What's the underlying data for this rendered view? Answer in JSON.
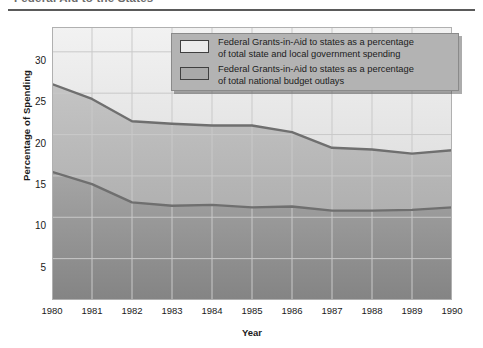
{
  "caption": "Federal Aid to the States",
  "chart_data": {
    "type": "area",
    "title": "Federal Aid to the States",
    "xlabel": "Year",
    "ylabel": "Percentage of Spending",
    "x": [
      1980,
      1981,
      1982,
      1983,
      1984,
      1985,
      1986,
      1987,
      1988,
      1989,
      1990
    ],
    "xticklabels": [
      "1980",
      "1981",
      "1982",
      "1983",
      "1984",
      "1985",
      "1986",
      "1987",
      "1988",
      "1989",
      "1990"
    ],
    "yticklabels": [
      "5",
      "10",
      "15",
      "20",
      "25",
      "30"
    ],
    "yticks": [
      5,
      10,
      15,
      20,
      25,
      30
    ],
    "ylim": [
      0,
      33
    ],
    "xlim": [
      1980,
      1990
    ],
    "grid": true,
    "legend_position": "upper-right-inside",
    "series": [
      {
        "name": "Federal Grants-in-Aid to states as a percentage of total state and local government spending",
        "swatch": "light",
        "color": "#ececec",
        "line_color": "#6f6f6f",
        "values": [
          26.1,
          24.3,
          21.6,
          21.3,
          21.1,
          21.1,
          20.3,
          18.4,
          18.2,
          17.7,
          18.1
        ]
      },
      {
        "name": "Federal Grants-in-Aid to states as a percentage of total national budget outlays",
        "swatch": "dark",
        "color": "#b0b0b0",
        "line_color": "#6f6f6f",
        "values": [
          15.5,
          14.0,
          11.8,
          11.4,
          11.5,
          11.2,
          11.3,
          10.8,
          10.8,
          10.9,
          11.2
        ]
      }
    ]
  },
  "legend": {
    "items": [
      {
        "line1": "Federal Grants-in-Aid to states as a percentage",
        "line2": "of total state and local government spending"
      },
      {
        "line1": "Federal Grants-in-Aid to states as a percentage",
        "line2": "of total national budget outlays"
      }
    ]
  },
  "colors": {
    "band_top": "#ededed",
    "band_middle": "#b8b8b8",
    "band_bottom": "#8f8f8f",
    "line": "#6d6d6d",
    "grid": "#c9c9c9",
    "legend_bg": "#b3b3b3",
    "rule": "#5a5a5a"
  }
}
